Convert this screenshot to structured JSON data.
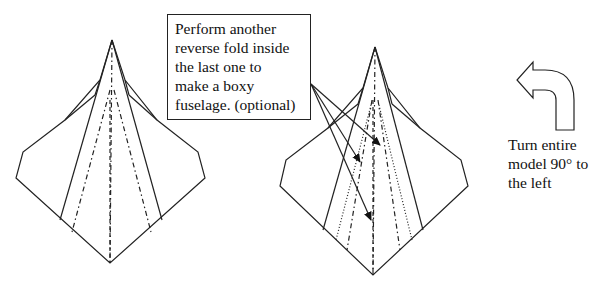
{
  "diagram": {
    "callout": {
      "lines": [
        "Perform another",
        "reverse fold inside",
        "the last one to",
        "make a boxy",
        "fuselage. (optional)"
      ]
    },
    "instruction": {
      "lines": [
        "Turn entire",
        "model 90° to",
        "the left"
      ]
    },
    "icons": {
      "turn_arrow": "curved-arrow-left-icon"
    },
    "figures": [
      "model-before-fold",
      "model-after-fold"
    ],
    "legend_line_styles": [
      "solid: edge",
      "dash: valley fold",
      "dash-dot: mountain fold",
      "dotted: hidden fold"
    ]
  }
}
